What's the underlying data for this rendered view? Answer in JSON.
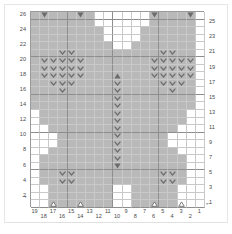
{
  "chart_data": {
    "type": "heatmap",
    "title": "",
    "xlabel": "",
    "ylabel": "",
    "columns": 19,
    "rows": 26,
    "column_labels": [
      "19",
      "18",
      "17",
      "16",
      "15",
      "14",
      "13",
      "12",
      "11",
      "10",
      "9",
      "8",
      "7",
      "6",
      "5",
      "4",
      "3",
      "2",
      "1"
    ],
    "row_labels_left": [
      "26",
      "24",
      "22",
      "20",
      "18",
      "16",
      "14",
      "12",
      "10",
      "8",
      "6",
      "4",
      "2"
    ],
    "row_labels_right": [
      "25",
      "23",
      "21",
      "19",
      "17",
      "15",
      "13",
      "11",
      "9",
      "7",
      "5",
      "3",
      "1"
    ],
    "legend": {
      "shaded": "#b9b9b9",
      "blank": "#ffffff",
      "symbol_color": "#6b6b6b",
      "grid_line": "#c9c9c9",
      "grid_line_major": "#8d8d8d"
    },
    "row_direction_markers": [
      {
        "row": 2,
        "side": "left",
        "glyph": "←"
      },
      {
        "row": 1,
        "side": "right",
        "glyph": "←"
      }
    ],
    "cells": [
      {
        "row": 26,
        "shaded": "0011111111000111111111111111111111111"
      },
      {
        "row": 26,
        "cols": "2-9,12-18",
        "symbols": [
          {
            "col": 18,
            "sym": "triangle-down"
          },
          {
            "col": 14,
            "sym": "triangle-down"
          },
          {
            "col": 6,
            "sym": "triangle-down"
          },
          {
            "col": 2,
            "sym": "triangle-down"
          }
        ]
      }
    ],
    "grid": [
      {
        "row": 26,
        "shaded": [
          19,
          18,
          17,
          16,
          15,
          14,
          13,
          6,
          5,
          4,
          3,
          2
        ],
        "symbols": {
          "18": "triangle-down",
          "14": "triangle-down",
          "6": "triangle-down",
          "2": "triangle-down"
        }
      },
      {
        "row": 25,
        "shaded": [
          19,
          18,
          17,
          16,
          15,
          14,
          13,
          6,
          5,
          4,
          3,
          2
        ],
        "symbols": {}
      },
      {
        "row": 24,
        "shaded": [
          19,
          18,
          17,
          16,
          15,
          14,
          13,
          12,
          7,
          6,
          5,
          4,
          3,
          2
        ],
        "symbols": {}
      },
      {
        "row": 23,
        "shaded": [
          19,
          18,
          17,
          16,
          15,
          14,
          13,
          12,
          7,
          6,
          5,
          4,
          3,
          2
        ],
        "symbols": {}
      },
      {
        "row": 22,
        "shaded": [
          19,
          18,
          17,
          16,
          15,
          14,
          13,
          12,
          11,
          8,
          7,
          6,
          5,
          4,
          3,
          2
        ],
        "symbols": {}
      },
      {
        "row": 21,
        "shaded": [
          19,
          18,
          17,
          16,
          15,
          14,
          13,
          12,
          11,
          10,
          9,
          8,
          7,
          6,
          5,
          4,
          3,
          2
        ],
        "symbols": {
          "16": "chev",
          "15": "chev",
          "5": "chev",
          "4": "chev"
        }
      },
      {
        "row": 20,
        "shaded": [
          19,
          18,
          17,
          16,
          15,
          14,
          13,
          12,
          11,
          10,
          9,
          8,
          7,
          6,
          5,
          4,
          3,
          2
        ],
        "symbols": {
          "18": "chev",
          "17": "chev",
          "16": "chev",
          "15": "chev",
          "14": "chev",
          "6": "chev",
          "5": "chev",
          "4": "chev",
          "3": "chev",
          "2": "chev"
        }
      },
      {
        "row": 19,
        "shaded": [
          19,
          18,
          17,
          16,
          15,
          14,
          13,
          12,
          11,
          10,
          9,
          8,
          7,
          6,
          5,
          4,
          3,
          2
        ],
        "symbols": {
          "18": "chev",
          "17": "chev",
          "16": "chev",
          "15": "chev",
          "14": "chev",
          "6": "chev",
          "5": "chev",
          "4": "chev",
          "3": "chev",
          "2": "chev"
        }
      },
      {
        "row": 18,
        "shaded": [
          19,
          18,
          17,
          16,
          15,
          14,
          13,
          12,
          11,
          10,
          9,
          8,
          7,
          6,
          5,
          4,
          3,
          2
        ],
        "symbols": {
          "18": "chev",
          "17": "chev",
          "16": "chev",
          "15": "chev",
          "14": "chev",
          "10": "triangle-up",
          "6": "chev",
          "5": "chev",
          "4": "chev",
          "3": "chev",
          "2": "chev"
        }
      },
      {
        "row": 17,
        "shaded": [
          19,
          18,
          17,
          16,
          15,
          14,
          13,
          12,
          11,
          10,
          9,
          8,
          7,
          6,
          5,
          4,
          3,
          2
        ],
        "symbols": {
          "17": "chev",
          "16": "chev",
          "15": "chev",
          "10": "chev",
          "5": "chev",
          "4": "chev",
          "3": "chev"
        }
      },
      {
        "row": 16,
        "shaded": [
          19,
          18,
          17,
          16,
          15,
          14,
          13,
          12,
          11,
          10,
          9,
          8,
          7,
          6,
          5,
          4,
          3,
          2
        ],
        "symbols": {
          "16": "chev",
          "10": "chev",
          "4": "chev"
        }
      },
      {
        "row": 15,
        "shaded": [
          19,
          18,
          17,
          16,
          15,
          14,
          13,
          12,
          11,
          10,
          9,
          8,
          7,
          6,
          5,
          4,
          3,
          2
        ],
        "symbols": {
          "10": "chev"
        }
      },
      {
        "row": 14,
        "shaded": [
          19,
          18,
          17,
          16,
          15,
          14,
          13,
          12,
          11,
          10,
          9,
          8,
          7,
          6,
          5,
          4,
          3,
          2
        ],
        "symbols": {
          "10": "chev"
        }
      },
      {
        "row": 13,
        "shaded": [
          18,
          17,
          16,
          15,
          14,
          13,
          12,
          11,
          10,
          9,
          8,
          7,
          6,
          5,
          4,
          3
        ],
        "symbols": {
          "10": "chev"
        }
      },
      {
        "row": 12,
        "shaded": [
          18,
          17,
          16,
          15,
          14,
          13,
          12,
          11,
          10,
          9,
          8,
          7,
          6,
          5,
          4,
          3
        ],
        "symbols": {
          "10": "chev"
        }
      },
      {
        "row": 11,
        "shaded": [
          17,
          16,
          15,
          14,
          13,
          12,
          11,
          10,
          9,
          8,
          7,
          6,
          5,
          4
        ],
        "symbols": {
          "10": "chev"
        }
      },
      {
        "row": 10,
        "shaded": [
          16,
          15,
          14,
          13,
          12,
          11,
          10,
          9,
          8,
          7,
          6,
          5
        ],
        "symbols": {
          "10": "chev"
        }
      },
      {
        "row": 9,
        "shaded": [
          16,
          15,
          14,
          13,
          12,
          11,
          10,
          9,
          8,
          7,
          6,
          5
        ],
        "symbols": {
          "10": "chev"
        }
      },
      {
        "row": 8,
        "shaded": [
          17,
          16,
          15,
          14,
          13,
          12,
          11,
          10,
          9,
          8,
          7,
          6,
          5,
          4
        ],
        "symbols": {
          "10": "chev"
        }
      },
      {
        "row": 7,
        "shaded": [
          18,
          17,
          16,
          15,
          14,
          13,
          12,
          11,
          10,
          9,
          8,
          7,
          6,
          5,
          4,
          3
        ],
        "symbols": {
          "10": "chev"
        }
      },
      {
        "row": 6,
        "shaded": [
          18,
          17,
          16,
          15,
          14,
          13,
          12,
          11,
          10,
          9,
          8,
          7,
          6,
          5,
          4,
          3
        ],
        "symbols": {
          "10": "triangle-down"
        }
      },
      {
        "row": 5,
        "shaded": [
          18,
          17,
          16,
          15,
          14,
          13,
          12,
          11,
          10,
          9,
          8,
          7,
          6,
          5,
          4,
          3
        ],
        "symbols": {
          "16": "chev",
          "15": "chev",
          "5": "chev",
          "4": "chev"
        }
      },
      {
        "row": 4,
        "shaded": [
          18,
          17,
          16,
          15,
          14,
          13,
          12,
          11,
          10,
          9,
          8,
          7,
          6,
          5,
          4,
          3
        ],
        "symbols": {
          "16": "chev",
          "15": "chev",
          "5": "chev",
          "4": "chev"
        }
      },
      {
        "row": 3,
        "shaded": [
          17,
          16,
          15,
          14,
          13,
          12,
          11,
          8,
          7,
          6,
          5,
          4
        ],
        "symbols": {}
      },
      {
        "row": 2,
        "shaded": [
          17,
          16,
          15,
          14,
          13,
          12,
          11,
          8,
          7,
          6,
          5,
          4
        ],
        "symbols": {}
      },
      {
        "row": 1,
        "shaded": [
          17,
          16,
          15,
          14,
          13,
          12,
          11,
          8,
          7,
          6,
          5,
          4
        ],
        "symbols": {
          "17": "triangle-up-open",
          "14": "triangle-up-open",
          "6": "triangle-up-open",
          "3": "triangle-up-open"
        }
      }
    ]
  }
}
